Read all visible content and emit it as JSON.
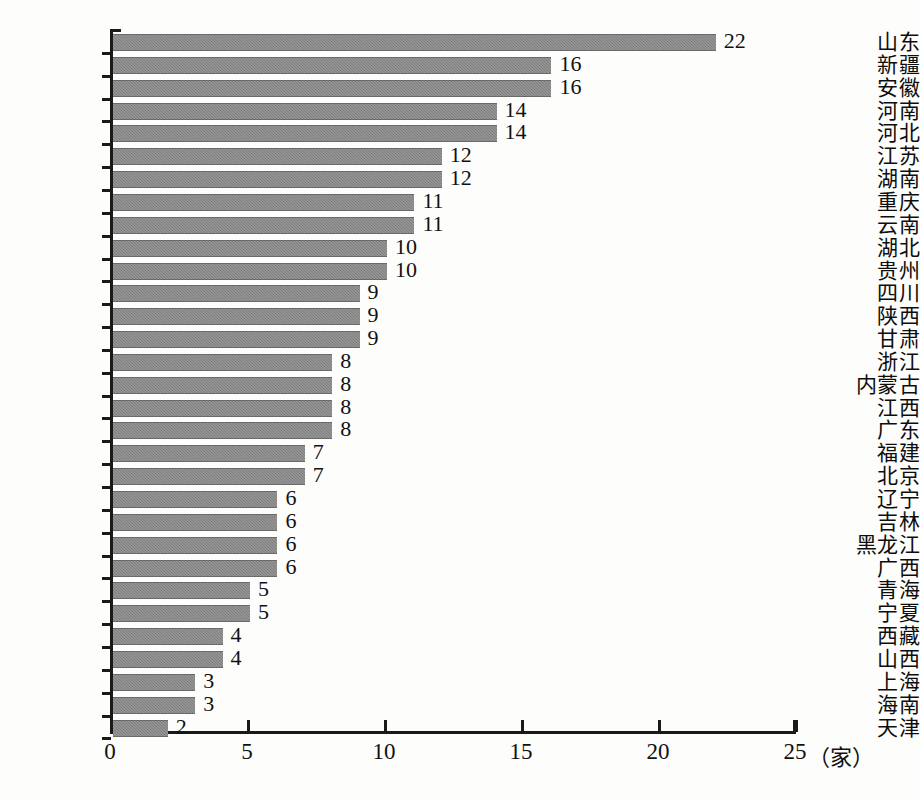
{
  "chart_data": {
    "type": "bar",
    "orientation": "horizontal",
    "title": "",
    "xlabel": "(家)",
    "ylabel": "",
    "xlim": [
      0,
      25
    ],
    "xticks": [
      0,
      5,
      10,
      15,
      20,
      25
    ],
    "xtick_labels": [
      "0",
      "5",
      "10",
      "15",
      "20",
      "25"
    ],
    "grid": false,
    "legend": null,
    "unit_label": "（家）",
    "categories": [
      "山东",
      "新疆",
      "安徽",
      "河南",
      "河北",
      "江苏",
      "湖南",
      "重庆",
      "云南",
      "湖北",
      "贵州",
      "四川",
      "陕西",
      "甘肃",
      "浙江",
      "内蒙古",
      "江西",
      "广东",
      "福建",
      "北京",
      "辽宁",
      "吉林",
      "黑龙江",
      "广西",
      "青海",
      "宁夏",
      "西藏",
      "山西",
      "上海",
      "海南",
      "天津"
    ],
    "values": [
      22,
      16,
      16,
      14,
      14,
      12,
      12,
      11,
      11,
      10,
      10,
      9,
      9,
      9,
      8,
      8,
      8,
      8,
      7,
      7,
      6,
      6,
      6,
      6,
      5,
      5,
      4,
      4,
      3,
      3,
      2
    ],
    "value_labels": [
      "22",
      "16",
      "16",
      "14",
      "14",
      "12",
      "12",
      "11",
      "11",
      "10",
      "10",
      "9",
      "9",
      "9",
      "8",
      "8",
      "8",
      "8",
      "7",
      "7",
      "6",
      "6",
      "6",
      "6",
      "5",
      "5",
      "4",
      "4",
      "3",
      "3",
      "2"
    ],
    "bar_color": "#7d7d7d",
    "axis_color": "#1a1a1a",
    "background_color": "#fdfdfc"
  }
}
